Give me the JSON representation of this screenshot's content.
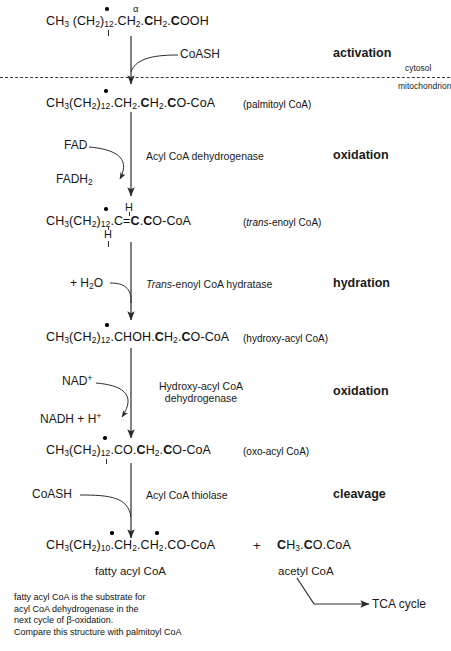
{
  "diagram": {
    "membrane": {
      "upper_label": "cytosol",
      "lower_label": "mitochondrion"
    },
    "stages": [
      {
        "name": "activation"
      },
      {
        "name": "oxidation"
      },
      {
        "name": "hydration"
      },
      {
        "name": "oxidation"
      },
      {
        "name": "cleavage"
      }
    ],
    "molecules": {
      "palmitic_acid": {
        "prefix": "CH",
        "p_sub": "3",
        "group": "(CH",
        "g_sub": "2",
        "g_close": ")",
        "g_count": "12",
        "rest_a": ".CH",
        "rest_a_sub": "2",
        "rest_b": ".CH",
        "rest_b_sub": "2",
        "rest_c": ".COOH",
        "alpha_symbol": "α",
        "full_text": "CH3 (CH2)12.CH2.CH2.COOH"
      },
      "palmitoyl_coa": {
        "full_text": "CH3(CH2)12.CH2.CH2.CO-CoA",
        "annotation": "(palmitoyl CoA)"
      },
      "trans_enoyl_coa": {
        "full_text": "CH3(CH2)12.C=C.CO-CoA",
        "h_top": "H",
        "h_bottom": "H",
        "annotation_open": "(",
        "annotation_italic": "trans",
        "annotation_rest": "-enoyl CoA)"
      },
      "hydroxy_acyl_coa": {
        "full_text": "CH3(CH2)12.CHOH.CH2.CO-CoA",
        "annotation": "(hydroxy-acyl CoA)"
      },
      "oxo_acyl_coa": {
        "full_text": "CH3(CH2)12.CO.CH2.CO-CoA",
        "annotation": "(oxo-acyl CoA)"
      },
      "fatty_acyl_coa": {
        "full_text": "CH3(CH2)10.CH2.CH2.CO-CoA",
        "name": "fatty acyl CoA"
      },
      "acetyl_coa": {
        "full_text": "CH3.CO.CoA",
        "name": "acetyl CoA"
      },
      "plus_sign": "+"
    },
    "cofactors": {
      "coash_in": "CoASH",
      "fad": "FAD",
      "fadh2": "FADH",
      "fadh2_sub": "2",
      "water": "+ H",
      "water_sub": "2",
      "water_rest": "O",
      "nad_plus": "NAD",
      "nad_sup": "+",
      "nadh": "NADH + H",
      "nadh_sup": "+",
      "coash_thiolase": "CoASH"
    },
    "enzymes": {
      "acyl_coa_dehydrogenase": "Acyl CoA dehydrogenase",
      "trans_enoyl_hydratase_italic": "Trans",
      "trans_enoyl_hydratase_rest": "-enoyl CoA hydratase",
      "hydroxy_acyl_dehydrogenase_l1": "Hydroxy-acyl CoA",
      "hydroxy_acyl_dehydrogenase_l2": "dehydrogenase",
      "acyl_coa_thiolase": "Acyl CoA thiolase"
    },
    "outputs": {
      "tca_cycle": "TCA cycle"
    },
    "footnote": {
      "line1": "fatty acyl CoA is the substrate for",
      "line2": "acyl CoA dehydrogenase  in the",
      "line3": "next cycle of β-oxidation.",
      "line4": "Compare this structure with palmitoyl CoA"
    },
    "colors": {
      "ink": "#1a1a1a",
      "line": "#2b2b2b",
      "membrane": "#3a3a3a"
    }
  }
}
